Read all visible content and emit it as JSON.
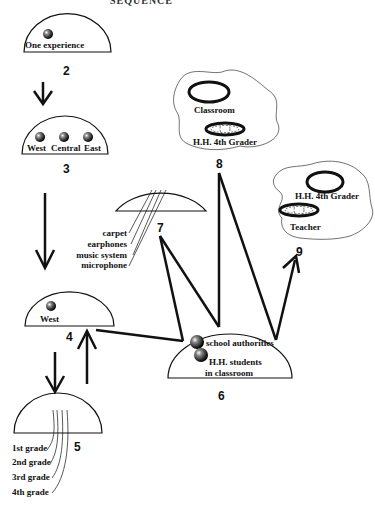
{
  "title": "SEQUENCE",
  "nodes": {
    "n2": {
      "number": "2",
      "labels": [
        "One experience"
      ]
    },
    "n3": {
      "number": "3",
      "labels": [
        "West",
        "Central",
        "East"
      ]
    },
    "n4": {
      "number": "4",
      "labels": [
        "West"
      ]
    },
    "n5": {
      "number": "5",
      "labels": [
        "1st grade",
        "2nd grade",
        "3rd grade",
        "4th grade"
      ]
    },
    "n6": {
      "number": "6",
      "labels": [
        "school authorities",
        "H.H. students",
        "in classroom"
      ]
    },
    "n7": {
      "number": "7",
      "labels": [
        "carpet",
        "earphones",
        "music system",
        "microphone"
      ]
    },
    "n8": {
      "number": "8",
      "labels": [
        "Classroom",
        "H.H. 4th Grader"
      ]
    },
    "n9": {
      "number": "9",
      "labels": [
        "H.H. 4th Grader",
        "Teacher"
      ]
    }
  },
  "colors": {
    "stroke": "#111111",
    "background": "#ffffff"
  }
}
